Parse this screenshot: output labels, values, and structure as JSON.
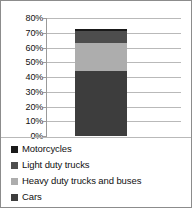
{
  "chart_data": {
    "type": "bar",
    "subtype": "stacked-column",
    "title": "",
    "subtitle": "",
    "xlabel": "",
    "ylabel": "",
    "categories": [
      ""
    ],
    "ylim": [
      0,
      80
    ],
    "ytick_labels": [
      "0%",
      "10%",
      "20%",
      "30%",
      "40%",
      "50%",
      "60%",
      "70%",
      "80%"
    ],
    "ytick_values": [
      0,
      10,
      20,
      30,
      40,
      50,
      60,
      70,
      80
    ],
    "grid": true,
    "legend_position": "bottom",
    "stack_order_bottom_to_top": [
      "Cars",
      "Heavy duty trucks and buses",
      "Light duty trucks",
      "Motorcycles"
    ],
    "total": 72.5,
    "series": [
      {
        "name": "Motorcycles",
        "values": [
          1.5
        ],
        "color": "#1a1a1a"
      },
      {
        "name": "Light duty trucks",
        "values": [
          8.0
        ],
        "color": "#4d4d4d"
      },
      {
        "name": "Heavy duty trucks and buses",
        "values": [
          19.0
        ],
        "color": "#adadad"
      },
      {
        "name": "Cars",
        "values": [
          44.0
        ],
        "color": "#3d3d3d"
      }
    ]
  },
  "axis": {
    "ticks": [
      {
        "label": "80%",
        "value": 80
      },
      {
        "label": "70%",
        "value": 70
      },
      {
        "label": "60%",
        "value": 60
      },
      {
        "label": "50%",
        "value": 50
      },
      {
        "label": "40%",
        "value": 40
      },
      {
        "label": "30%",
        "value": 30
      },
      {
        "label": "20%",
        "value": 20
      },
      {
        "label": "10%",
        "value": 10
      },
      {
        "label": "0%",
        "value": 0
      }
    ]
  },
  "legend": {
    "items": [
      {
        "label": "Motorcycles",
        "color": "#1a1a1a"
      },
      {
        "label": "Light duty trucks",
        "color": "#4d4d4d"
      },
      {
        "label": "Heavy duty trucks and buses",
        "color": "#adadad"
      },
      {
        "label": "Cars",
        "color": "#3d3d3d"
      }
    ]
  }
}
